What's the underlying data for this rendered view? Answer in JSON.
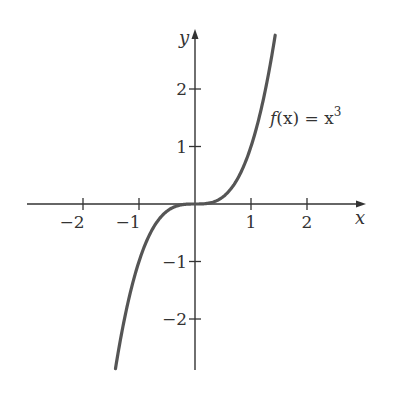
{
  "chart_data": {
    "type": "line",
    "title": "",
    "function": "f(x) = x^3",
    "series": [
      {
        "name": "f(x) = x^3",
        "x": [
          -1.4,
          -1.2,
          -1.0,
          -0.8,
          -0.6,
          -0.4,
          -0.2,
          0,
          0.2,
          0.4,
          0.6,
          0.8,
          1.0,
          1.2,
          1.4
        ],
        "values": [
          -2.744,
          -1.728,
          -1.0,
          -0.512,
          -0.216,
          -0.064,
          -0.008,
          0,
          0.008,
          0.064,
          0.216,
          0.512,
          1.0,
          1.728,
          2.744
        ]
      }
    ],
    "xlabel": "x",
    "ylabel": "y",
    "xticks": [
      -2,
      -1,
      1,
      2
    ],
    "yticks": [
      -2,
      -1,
      1,
      2
    ],
    "xtick_labels": [
      "−2",
      "−1",
      "1",
      "2"
    ],
    "ytick_labels": [
      "−2",
      "−1",
      "1",
      "2"
    ],
    "xlim": [
      -3,
      3
    ],
    "ylim": [
      -2.9,
      3.0
    ],
    "grid": false,
    "legend": "none",
    "annotations": [
      {
        "text": "f(x) = x³",
        "x": 1.35,
        "y": 1.5
      }
    ],
    "line_color": "#555555"
  },
  "labels": {
    "x_axis": "x",
    "y_axis": "y",
    "fn_f": "f",
    "fn_rest": "(x) = x",
    "fn_exp": "3"
  }
}
